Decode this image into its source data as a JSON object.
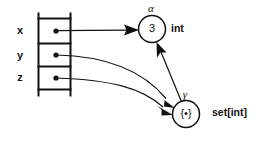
{
  "diagram": {
    "colors": {
      "ink": "#111111",
      "background": "#ffffff"
    },
    "frame": {
      "name": "environment-frame",
      "slots": [
        {
          "label": "x",
          "value_kind": "pointer",
          "target": "alpha-node"
        },
        {
          "label": "y",
          "value_kind": "pointer",
          "target": "gamma-node"
        },
        {
          "label": "z",
          "value_kind": "pointer",
          "target": "gamma-node"
        }
      ]
    },
    "nodes": [
      {
        "id": "alpha-node",
        "tyvar": "α",
        "value": "3",
        "type_label": "int"
      },
      {
        "id": "gamma-node",
        "tyvar": "γ",
        "value": "{•}",
        "type_label": "set[int]"
      }
    ],
    "edges": [
      {
        "from": "slot-x",
        "to": "alpha-node",
        "style": "straight"
      },
      {
        "from": "slot-y",
        "to": "gamma-node",
        "style": "curved"
      },
      {
        "from": "slot-z",
        "to": "gamma-node",
        "style": "curved"
      },
      {
        "from": "gamma-node",
        "to": "alpha-node",
        "style": "straight"
      }
    ]
  }
}
